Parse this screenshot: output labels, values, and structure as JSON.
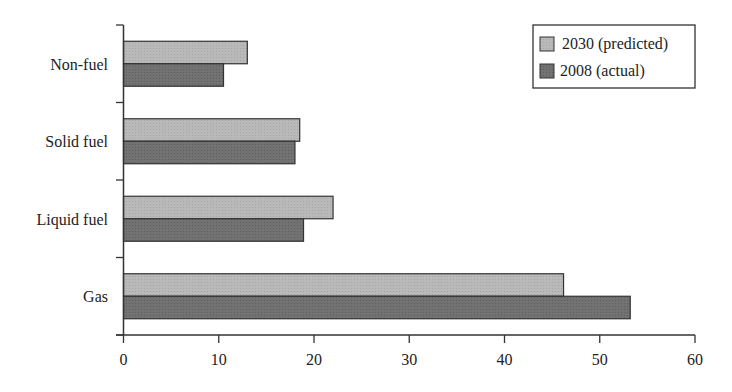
{
  "chart_data": {
    "type": "bar",
    "orientation": "horizontal",
    "title": "",
    "xlabel": "",
    "ylabel": "",
    "categories": [
      "Non-fuel",
      "Solid fuel",
      "Liquid fuel",
      "Gas"
    ],
    "series": [
      {
        "name": "2030 (predicted)",
        "color": "#b4b4b4",
        "values": [
          13,
          18.5,
          22,
          46.2
        ]
      },
      {
        "name": "2008 (actual)",
        "color": "#6f6f6f",
        "values": [
          10.5,
          18,
          18.9,
          53.2
        ]
      }
    ],
    "xlim": [
      0,
      60
    ],
    "xticks": [
      0,
      10,
      20,
      30,
      40,
      50,
      60
    ],
    "grid": false,
    "legend_position": "upper right"
  }
}
